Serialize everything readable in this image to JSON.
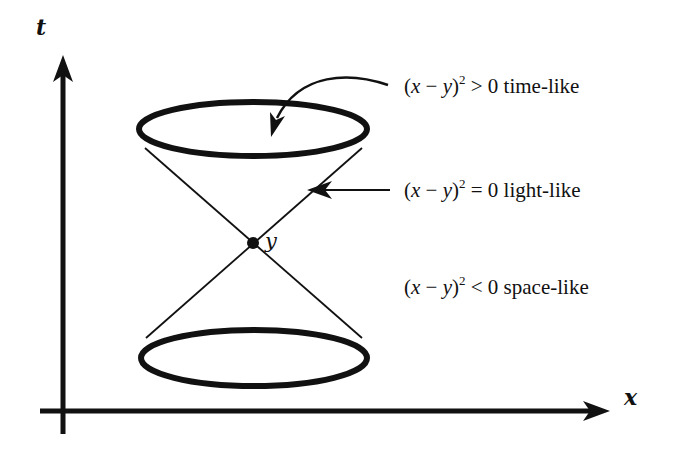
{
  "diagram": {
    "stroke_color": "#111111",
    "background": "#ffffff",
    "axes": {
      "t": {
        "label": "t",
        "direction": "up"
      },
      "x": {
        "label": "x",
        "direction": "right"
      }
    },
    "apex": {
      "label": "y"
    },
    "regions": [
      {
        "id": "time-like",
        "expr_open": "(",
        "var1": "x",
        "minus": " − ",
        "var2": "y",
        "expr_close": ")",
        "exponent": "2",
        "relation": " > 0 ",
        "name": "time-like"
      },
      {
        "id": "light-like",
        "expr_open": "(",
        "var1": "x",
        "minus": " − ",
        "var2": "y",
        "expr_close": ")",
        "exponent": "2",
        "relation": " = 0 ",
        "name": "light-like"
      },
      {
        "id": "space-like",
        "expr_open": "(",
        "var1": "x",
        "minus": " − ",
        "var2": "y",
        "expr_close": ")",
        "exponent": "2",
        "relation": " < 0 ",
        "name": "space-like"
      }
    ]
  }
}
